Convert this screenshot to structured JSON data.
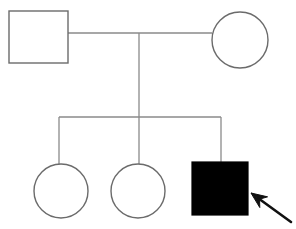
{
  "diagram": {
    "type": "pedigree",
    "canvas": {
      "width": 296,
      "height": 229
    },
    "background_color": "#ffffff",
    "line_color": "#8a8a8a",
    "symbol_outline_color": "#6b6b6b",
    "affected_fill_color": "#000000",
    "unaffected_fill_color": "#ffffff",
    "arrow_color": "#111111"
  },
  "generations": [
    {
      "label": "I",
      "members": [
        {
          "id": "I-1",
          "symbol": "square",
          "sex": "male",
          "status": "unaffected",
          "filled": false,
          "role": "father",
          "x": 9,
          "y": 11,
          "width": 59,
          "height": 52
        },
        {
          "id": "I-2",
          "symbol": "circle",
          "sex": "female",
          "status": "unaffected",
          "filled": false,
          "role": "mother",
          "cx": 240,
          "cy": 40,
          "r": 28
        }
      ]
    },
    {
      "label": "II",
      "members": [
        {
          "id": "II-1",
          "symbol": "circle",
          "sex": "female",
          "status": "unaffected",
          "filled": false,
          "role": "daughter",
          "cx": 61,
          "cy": 191,
          "r": 27
        },
        {
          "id": "II-2",
          "symbol": "circle",
          "sex": "female",
          "status": "unaffected",
          "filled": false,
          "role": "daughter",
          "cx": 138,
          "cy": 191,
          "r": 27
        },
        {
          "id": "II-3",
          "symbol": "square",
          "sex": "male",
          "status": "affected",
          "filled": true,
          "role": "son",
          "x": 192,
          "y": 162,
          "width": 56,
          "height": 53
        }
      ]
    }
  ],
  "connections": {
    "mating_line": {
      "x1": 68,
      "y1": 33,
      "x2": 212,
      "y2": 33
    },
    "descent_line": {
      "x1": 139,
      "y1": 33,
      "x2": 139,
      "y2": 117
    },
    "sibship_line": {
      "x1": 59,
      "y1": 117,
      "x2": 221,
      "y2": 117
    },
    "drop_lines": [
      {
        "child": "II-1",
        "x1": 59,
        "y1": 117,
        "x2": 59,
        "y2": 166
      },
      {
        "child": "II-2",
        "x1": 139,
        "y1": 117,
        "x2": 139,
        "y2": 165
      },
      {
        "child": "II-3",
        "x1": 221,
        "y1": 117,
        "x2": 221,
        "y2": 162
      }
    ]
  },
  "annotations": {
    "proband_arrow": {
      "name": "proband-arrow",
      "points_to": "II-3",
      "tail_x": 291,
      "tail_y": 222,
      "tip_x": 251,
      "tip_y": 193
    }
  }
}
